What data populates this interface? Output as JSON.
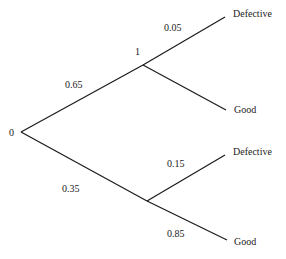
{
  "diagram": {
    "type": "probability-tree",
    "root": {
      "label": "0",
      "x": 21,
      "y": 132,
      "label_x": 9,
      "label_y": 136
    },
    "nodes": [
      {
        "id": "upper",
        "label": "1",
        "x": 143,
        "y": 65,
        "label_x": 135,
        "label_y": 55
      },
      {
        "id": "lower",
        "label": "",
        "x": 147,
        "y": 201,
        "label_x": 0,
        "label_y": 0
      }
    ],
    "branches": [
      {
        "id": "root-upper",
        "from": [
          21,
          132
        ],
        "to": [
          143,
          65
        ],
        "probability": "0.65",
        "prob_x": 65,
        "prob_y": 88
      },
      {
        "id": "root-lower",
        "from": [
          21,
          132
        ],
        "to": [
          147,
          201
        ],
        "probability": "0.35",
        "prob_x": 62,
        "prob_y": 192
      },
      {
        "id": "upper-defective",
        "from": [
          143,
          65
        ],
        "to": [
          225,
          17
        ],
        "probability": "0.05",
        "prob_x": 164,
        "prob_y": 31
      },
      {
        "id": "upper-good",
        "from": [
          143,
          65
        ],
        "to": [
          226,
          110
        ],
        "probability": "",
        "prob_x": 0,
        "prob_y": 0
      },
      {
        "id": "lower-defective",
        "from": [
          147,
          201
        ],
        "to": [
          225,
          155
        ],
        "probability": "0.15",
        "prob_x": 167,
        "prob_y": 167
      },
      {
        "id": "lower-good",
        "from": [
          147,
          201
        ],
        "to": [
          227,
          240
        ],
        "probability": "0.85",
        "prob_x": 167,
        "prob_y": 237
      }
    ],
    "outcomes": [
      {
        "id": "upper-defective",
        "label": "Defective",
        "x": 233,
        "y": 17
      },
      {
        "id": "upper-good",
        "label": "Good",
        "x": 234,
        "y": 113
      },
      {
        "id": "lower-defective",
        "label": "Defective",
        "x": 233,
        "y": 155
      },
      {
        "id": "lower-good",
        "label": "Good",
        "x": 234,
        "y": 245
      }
    ]
  }
}
